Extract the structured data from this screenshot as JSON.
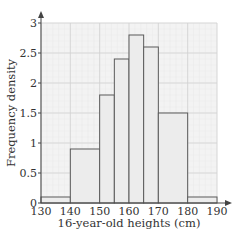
{
  "chart_data": {
    "type": "bar",
    "subtype": "histogram",
    "title": "",
    "xlabel": "16-year-old heights (cm)",
    "ylabel": "Frequency density",
    "xlim": [
      130,
      190
    ],
    "ylim": [
      0,
      3
    ],
    "grid": true,
    "legend": null,
    "x_ticks": [
      130,
      140,
      150,
      160,
      170,
      180,
      190
    ],
    "x_tick_labels": [
      "130",
      "140",
      "150",
      "160",
      "170",
      "180",
      "190"
    ],
    "y_ticks": [
      0,
      0.5,
      1,
      1.5,
      2,
      2.5,
      3
    ],
    "y_tick_labels": [
      "0",
      "0.5",
      "1",
      "1.5",
      "2",
      "2.5",
      "3"
    ],
    "bins": [
      {
        "from": 130,
        "to": 140,
        "density": 0.1
      },
      {
        "from": 140,
        "to": 150,
        "density": 0.9
      },
      {
        "from": 150,
        "to": 155,
        "density": 1.8
      },
      {
        "from": 155,
        "to": 160,
        "density": 2.4
      },
      {
        "from": 160,
        "to": 165,
        "density": 2.8
      },
      {
        "from": 165,
        "to": 170,
        "density": 2.6
      },
      {
        "from": 170,
        "to": 180,
        "density": 1.5
      },
      {
        "from": 180,
        "to": 190,
        "density": 0.1
      }
    ],
    "categories": [
      "130-140",
      "140-150",
      "150-155",
      "155-160",
      "160-165",
      "165-170",
      "170-180",
      "180-190"
    ],
    "values": [
      0.1,
      0.9,
      1.8,
      2.4,
      2.8,
      2.6,
      1.5,
      0.1
    ]
  },
  "colors": {
    "bar_fill": "#ececec",
    "bar_stroke": "#5a5a5a",
    "grid_major": "#d2d2d2",
    "grid_minor": "#e8e8e8",
    "plot_bg": "#f3f3f3",
    "axis": "#444444"
  }
}
